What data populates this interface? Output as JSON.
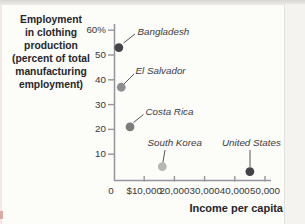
{
  "figure": {
    "y_axis_title": "Employment\nin clothing\nproduction\n(percent of total\nmanufacturing\nemployment)",
    "x_axis_title": "Income per capita"
  },
  "colors": {
    "axis": "#96969a",
    "leader_line": "#55555a",
    "title_text": "#26262c",
    "tick_text": "#38383c",
    "country_label_text": "#3b3b3f",
    "background": "#fcfcf8"
  },
  "chart_data": {
    "type": "scatter",
    "xlabel": "Income per capita",
    "ylabel": "Employment in clothing production (percent of total manufacturing employment)",
    "xlim": [
      0,
      52000
    ],
    "ylim": [
      0,
      63
    ],
    "grid": false,
    "legend": "none (points labeled directly with leader lines)",
    "x_ticks": [
      {
        "value": 0,
        "label": "0"
      },
      {
        "value": 10000,
        "label": "$10,000"
      },
      {
        "value": 20000,
        "label": "20,000"
      },
      {
        "value": 30000,
        "label": "30,000"
      },
      {
        "value": 40000,
        "label": "40,000"
      },
      {
        "value": 50000,
        "label": "50,000"
      }
    ],
    "y_ticks": [
      {
        "value": 60,
        "label": "60%"
      },
      {
        "value": 50,
        "label": "50"
      },
      {
        "value": 40,
        "label": "40"
      },
      {
        "value": 30,
        "label": "30"
      },
      {
        "value": 20,
        "label": "20"
      },
      {
        "value": 10,
        "label": "10"
      }
    ],
    "points": [
      {
        "label": "Bangladesh",
        "x": 1600,
        "y": 53,
        "color": "#454549"
      },
      {
        "label": "El Salvador",
        "x": 2400,
        "y": 37,
        "color": "#8e8e91"
      },
      {
        "label": "Costa Rica",
        "x": 5300,
        "y": 21,
        "color": "#7c7c7f"
      },
      {
        "label": "South Korea",
        "x": 16000,
        "y": 5,
        "color": "#b5b8b0"
      },
      {
        "label": "United States",
        "x": 45000,
        "y": 3,
        "color": "#434347"
      }
    ]
  }
}
